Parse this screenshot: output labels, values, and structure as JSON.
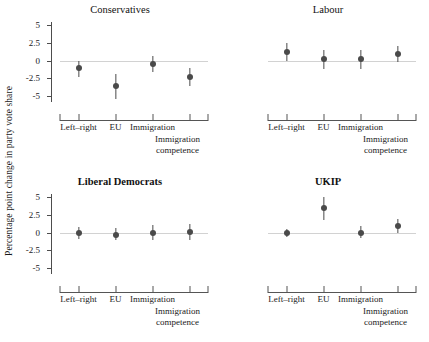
{
  "figure": {
    "ylabel": "Percentage point change in party vote share",
    "categories": [
      "Left–right",
      "EU",
      "Immigration",
      "Immigration competence"
    ],
    "category_lines": [
      [
        "Left–right"
      ],
      [
        "EU"
      ],
      [
        "Immigration"
      ],
      [
        "Immigration",
        "competence"
      ]
    ],
    "yticks": [
      "5",
      "2.5",
      "0",
      "-2.5",
      "-5"
    ],
    "ytick_values": [
      5,
      2.5,
      0,
      -2.5,
      -5
    ],
    "colors": {
      "point": "#4a4a4a",
      "errorbar": "#4a4a4a",
      "zeroline": "#d2d2d2",
      "axis": "#4d4d4d",
      "text": "#1a1a1a",
      "background": "#ffffff"
    }
  },
  "chart_data": {
    "type": "scatter",
    "title": "",
    "xlabel": "",
    "ylabel": "Percentage point change in party vote share",
    "ylim": [
      -5.8,
      5.4
    ],
    "yticks": [
      5,
      2.5,
      0,
      -2.5,
      -5
    ],
    "grid": false,
    "legend": "none",
    "layout": "2x2 facet grid of dot-and-whisker (coefficient) plots",
    "categories": [
      "Left–right",
      "EU",
      "Immigration",
      "Immigration competence"
    ],
    "annotations": [
      "horizontal reference line at y = 0 in every panel"
    ],
    "panels": [
      {
        "title": "Conservatives",
        "estimates": [
          -1.1,
          -3.6,
          -0.5,
          -2.3
        ],
        "ci_low": [
          -2.3,
          -5.4,
          -1.6,
          -3.6
        ],
        "ci_high": [
          0.0,
          -1.9,
          0.7,
          -1.1
        ]
      },
      {
        "title": "Labour",
        "estimates": [
          1.2,
          0.2,
          0.2,
          0.9
        ],
        "ci_low": [
          0.0,
          -1.2,
          -1.2,
          -0.2
        ],
        "ci_high": [
          2.4,
          1.5,
          1.5,
          2.1
        ]
      },
      {
        "title": "Liberal Democrats",
        "estimates": [
          -0.1,
          -0.3,
          0.0,
          0.1
        ],
        "ci_low": [
          -0.9,
          -1.1,
          -1.1,
          -1.0
        ],
        "ci_high": [
          0.8,
          0.7,
          1.1,
          1.2
        ]
      },
      {
        "title": "UKIP",
        "estimates": [
          -0.1,
          3.4,
          0.0,
          0.9
        ],
        "ci_low": [
          -0.6,
          1.7,
          -0.8,
          0.0
        ],
        "ci_high": [
          0.5,
          5.0,
          0.9,
          1.9
        ]
      }
    ]
  }
}
